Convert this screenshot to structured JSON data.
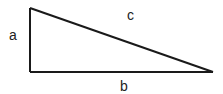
{
  "diagram": {
    "type": "right-triangle",
    "stroke_color": "#1a1a1a",
    "vertices": {
      "top_left": [
        30,
        8
      ],
      "bottom_left": [
        30,
        72
      ],
      "bottom_right": [
        213,
        72
      ]
    },
    "labels": {
      "a": "a",
      "b": "b",
      "c": "c"
    }
  }
}
